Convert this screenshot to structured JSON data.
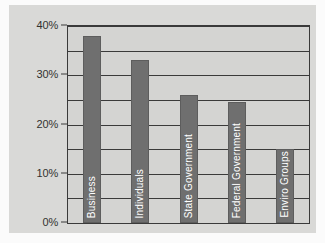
{
  "chart_data": {
    "type": "bar",
    "title": "",
    "xlabel": "",
    "ylabel": "",
    "categories": [
      "Business",
      "Individuals",
      "State Government",
      "Federal Government",
      "Enviro Groups"
    ],
    "values": [
      38,
      33,
      26,
      24.5,
      15
    ],
    "ylim": [
      0,
      40
    ],
    "ytick_labels": [
      "0%",
      "10%",
      "20%",
      "30%",
      "40%"
    ],
    "ytick_values": [
      0,
      10,
      20,
      30,
      40
    ],
    "gridline_values": [
      0,
      5,
      10,
      15,
      20,
      25,
      30,
      35,
      40
    ],
    "grid": true,
    "legend": "none",
    "bar_color": "#6f6f6f",
    "plot_background": "#d4d4d2",
    "canvas_background": "#d9d9d7",
    "axis_color": "#3a3a3a",
    "label_color": "#ffffff"
  }
}
